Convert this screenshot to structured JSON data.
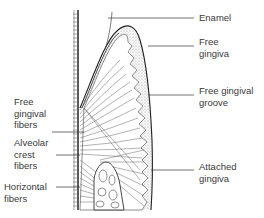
{
  "diagram": {
    "colors": {
      "line": "#333333",
      "stipple": "#cfcfcf",
      "background": "#ffffff",
      "text": "#3a3a3a"
    },
    "labels": {
      "enamel": "Enamel",
      "free_gingiva": "Free\ngingiva",
      "free_gingival_groove": "Free gingival\ngroove",
      "attached_gingiva": "Attached\ngingiva",
      "free_gingival_fibers": "Free\ngingival\nfibers",
      "alveolar_crest_fibers": "Alveolar\ncrest\nfibers",
      "horizontal_fibers": "Horizontal\nfibers"
    }
  }
}
